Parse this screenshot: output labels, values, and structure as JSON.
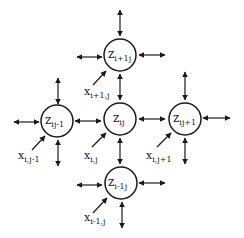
{
  "diagram": {
    "type": "2D lattice neural network neighborhood",
    "nodes": [
      {
        "id": "top",
        "main": "z",
        "sub": "i+1j",
        "cx": 120,
        "cy": 55
      },
      {
        "id": "left",
        "main": "z",
        "sub": "ij-1",
        "cx": 56,
        "cy": 121
      },
      {
        "id": "center",
        "main": "z",
        "sub": "ij",
        "cx": 120,
        "cy": 119
      },
      {
        "id": "right",
        "main": "z",
        "sub": "ij+1",
        "cx": 183,
        "cy": 119
      },
      {
        "id": "bottom",
        "main": "z",
        "sub": "i-1j",
        "cx": 120,
        "cy": 183
      }
    ],
    "inputs": [
      {
        "for": "top",
        "main": "x",
        "sub": "i+1,j"
      },
      {
        "for": "left",
        "main": "x",
        "sub": "i,j-1"
      },
      {
        "for": "center",
        "main": "x",
        "sub": "i,j"
      },
      {
        "for": "right",
        "main": "x",
        "sub": "i,j+1"
      },
      {
        "for": "bottom",
        "main": "x",
        "sub": "i-1,j"
      }
    ],
    "colors": {
      "stroke": "#1a1a1a",
      "background": "#ffffff"
    }
  }
}
